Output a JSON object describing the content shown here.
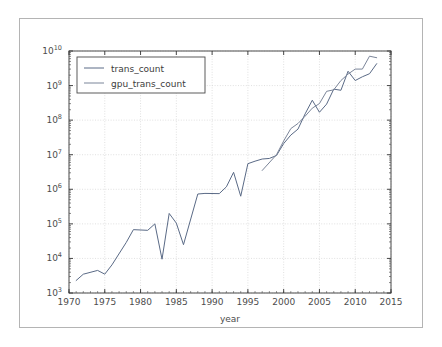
{
  "figure": {
    "background": "#ffffff",
    "frame_color": "#b4b4b4"
  },
  "chart_data": {
    "type": "line",
    "title": "",
    "xlabel": "year",
    "ylabel": "",
    "yscale": "log",
    "xlim": [
      1970,
      2015
    ],
    "ylim": [
      1000,
      10000000000
    ],
    "grid": true,
    "grid_style": "dotted",
    "legend_position": "upper left",
    "xticks": [
      "1970",
      "1975",
      "1980",
      "1985",
      "1990",
      "1995",
      "2000",
      "2005",
      "2010",
      "2015"
    ],
    "xtick_values": [
      1970,
      1975,
      1980,
      1985,
      1990,
      1995,
      2000,
      2005,
      2010,
      2015
    ],
    "ytick_labels": [
      "10³",
      "10⁴",
      "10⁵",
      "10⁶",
      "10⁷",
      "10⁸",
      "10⁹",
      "10¹⁰"
    ],
    "ytick_mantissa": [
      "10",
      "10",
      "10",
      "10",
      "10",
      "10",
      "10",
      "10"
    ],
    "ytick_exponents": [
      "3",
      "4",
      "5",
      "6",
      "7",
      "8",
      "9",
      "10"
    ],
    "ytick_values": [
      1000,
      10000,
      100000,
      1000000,
      10000000,
      100000000,
      1000000000,
      10000000000
    ],
    "series": [
      {
        "name": "trans_count",
        "color": "#5a6a86",
        "x": [
          1971,
          1972,
          1974,
          1975,
          1976,
          1978,
          1979,
          1981,
          1982,
          1983,
          1984,
          1985,
          1986,
          1988,
          1989,
          1991,
          1992,
          1993,
          1994,
          1995,
          1996,
          1997,
          1998,
          1999,
          2000,
          2001,
          2002,
          2003,
          2004,
          2005,
          2006,
          2007,
          2008,
          2009,
          2010,
          2011,
          2012,
          2013
        ],
        "values": [
          2300,
          3500,
          4500,
          3510,
          6500,
          29000,
          68000,
          65000,
          100000,
          9500,
          200000,
          105000,
          25000,
          730000,
          760000,
          750000,
          1180000,
          3100000,
          630000,
          5500000,
          6500000,
          7500000,
          7800000,
          9500000,
          21000000,
          37000000,
          55000000,
          152000000,
          377000000,
          169000000,
          291000000,
          789000000,
          731000000,
          2600000000,
          1400000000,
          1800000000,
          2200000000,
          4300000000
        ]
      },
      {
        "name": "gpu_trans_count",
        "color": "#7b8599",
        "x": [
          1997,
          1999,
          2000,
          2001,
          2002,
          2003,
          2004,
          2005,
          2006,
          2007,
          2008,
          2009,
          2010,
          2011,
          2012,
          2013
        ],
        "values": [
          3500000,
          10000000,
          25000000,
          57000000,
          80000000,
          130000000,
          222000000,
          302000000,
          681000000,
          754000000,
          1400000000,
          2154000000,
          3000000000,
          3000000000,
          7080000000,
          6400000000
        ]
      }
    ]
  },
  "legend": {
    "entries": [
      {
        "label": "trans_count",
        "color": "#5a6a86"
      },
      {
        "label": "gpu_trans_count",
        "color": "#7b8599"
      }
    ]
  }
}
